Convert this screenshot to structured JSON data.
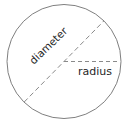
{
  "figure": {
    "background_color": "#ffffff",
    "stroke_color": "#7f7f7f",
    "text_color": "#262626"
  },
  "circle": {
    "center_x": 64,
    "center_y": 61.5,
    "radius": 57,
    "stroke_width": 1
  },
  "lines": {
    "diameter": {
      "label": "diameter",
      "x1": 24.2,
      "y1": 102,
      "x2": 103.8,
      "y2": 21,
      "dash": "5 3",
      "angle_deg": -44
    },
    "radius": {
      "label": "radius",
      "x1": 64,
      "y1": 61.5,
      "x2": 120,
      "y2": 61.5,
      "dash": "4 3",
      "angle_deg": 0
    }
  },
  "labels": {
    "diameter": "diameter",
    "radius": "radius"
  }
}
